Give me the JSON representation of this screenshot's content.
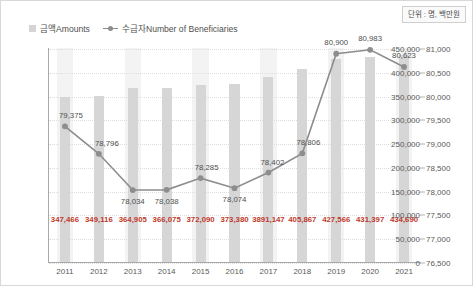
{
  "unit_note": "단위 : 명, 백만원",
  "legend": {
    "bar_label": "금액Amounts",
    "line_label": "수급자Number of Beneficiaries",
    "bar_color": "#d6d6d6",
    "line_color": "#8d8d8d"
  },
  "chart_data": {
    "type": "bar",
    "title": "",
    "subtitle": "",
    "xlabel": "",
    "ylabel": "",
    "categories": [
      "2011",
      "2012",
      "2013",
      "2014",
      "2015",
      "2016",
      "2017",
      "2018",
      "2019",
      "2020",
      "2021"
    ],
    "grid": true,
    "legend_position": "top-left",
    "left_axis": {
      "name": "금액Amounts",
      "ylim": [
        0,
        450000
      ],
      "tick_step": 50000,
      "ticks": [
        "0",
        "50,000",
        "100,000",
        "150,000",
        "200,000",
        "250,000",
        "300,000",
        "350,000",
        "400,000",
        "450,000"
      ],
      "tick_values": [
        0,
        50000,
        100000,
        150000,
        200000,
        250000,
        300000,
        350000,
        400000,
        450000
      ]
    },
    "right_axis": {
      "name": "수급자Number of Beneficiaries",
      "ylim": [
        76500,
        81000
      ],
      "tick_step": 500,
      "ticks": [
        "76,500",
        "77,000",
        "77,500",
        "78,000",
        "78,500",
        "79,000",
        "79,500",
        "80,000",
        "80,500",
        "81,000"
      ],
      "tick_values": [
        76500,
        77000,
        77500,
        78000,
        78500,
        79000,
        79500,
        80000,
        80500,
        81000
      ]
    },
    "series": [
      {
        "name": "금액Amounts",
        "type": "bar",
        "axis": "left",
        "values": [
          347466,
          349116,
          364905,
          366075,
          372090,
          373380,
          389147,
          405867,
          427566,
          431397,
          434690
        ],
        "labels": [
          "347,466",
          "349,116",
          "364,905",
          "366,075",
          "372,090",
          "373,380",
          "3891,147",
          "405,867",
          "427,566",
          "431,397",
          "434,690"
        ]
      },
      {
        "name": "수급자Number of Beneficiaries",
        "type": "line",
        "axis": "right",
        "values": [
          79375,
          78796,
          78034,
          78038,
          78285,
          78074,
          78402,
          78806,
          80900,
          80983,
          80623
        ],
        "labels": [
          "79,375",
          "78,796",
          "78,034",
          "78,038",
          "78,285",
          "78,074",
          "78,402",
          "78,806",
          "80,900",
          "80,983",
          "80,623"
        ]
      }
    ]
  }
}
